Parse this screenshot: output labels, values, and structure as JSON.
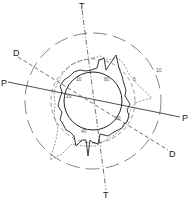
{
  "diagram": {
    "axes": [
      {
        "id": "T",
        "label_start": "T",
        "label_end": "T",
        "style": "dash-dot"
      },
      {
        "id": "P",
        "label_start": "P",
        "label_end": "P",
        "style": "solid"
      },
      {
        "id": "D",
        "label_start": "D",
        "label_end": "D",
        "style": "dashed"
      }
    ],
    "circles": [
      {
        "id": "inner",
        "style": "solid"
      },
      {
        "id": "middle",
        "style": "dashed",
        "label": "5"
      },
      {
        "id": "outer",
        "style": "long-dash",
        "label": "10"
      }
    ],
    "angle_labels": [
      "10",
      "80",
      "20",
      "60",
      "40"
    ],
    "colors": {
      "line": "#222222",
      "dashed": "#555555",
      "background": "#ffffff"
    }
  }
}
